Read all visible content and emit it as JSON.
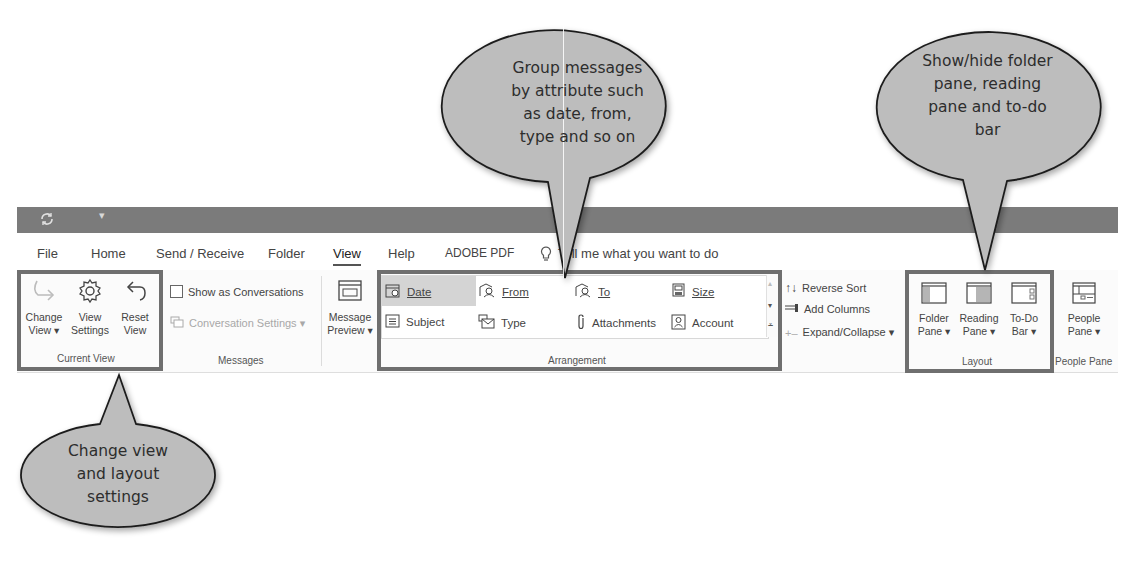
{
  "title_bar": {
    "quick_access": [
      "sync-icon",
      "customize-dropdown-icon"
    ]
  },
  "tabs": [
    {
      "label": "File"
    },
    {
      "label": "Home"
    },
    {
      "label": "Send / Receive"
    },
    {
      "label": "Folder"
    },
    {
      "label": "View",
      "active": true
    },
    {
      "label": "Help"
    },
    {
      "label": "ADOBE PDF"
    }
  ],
  "tell_me": {
    "icon": "lightbulb-icon",
    "text": "Tell me what you want to do"
  },
  "ribbon": {
    "current_view": {
      "label": "Current View",
      "buttons": [
        {
          "line1": "Change",
          "line2": "View ▾",
          "icon": "change-view-icon"
        },
        {
          "line1": "View",
          "line2": "Settings",
          "icon": "gear-icon"
        },
        {
          "line1": "Reset",
          "line2": "View",
          "icon": "undo-arrow-icon"
        }
      ]
    },
    "messages": {
      "label": "Messages",
      "show_as_conversations": "Show as Conversations",
      "conversation_settings": "Conversation Settings ▾"
    },
    "message_preview": {
      "line1": "Message",
      "line2": "Preview ▾"
    },
    "arrangement": {
      "label": "Arrangement",
      "items": [
        {
          "label": "Date",
          "icon": "calendar-clock-icon",
          "selected": true
        },
        {
          "label": "From",
          "icon": "from-people-icon"
        },
        {
          "label": "To",
          "icon": "to-people-icon"
        },
        {
          "label": "Size",
          "icon": "size-icon"
        },
        {
          "label": "Subject",
          "icon": "subject-lines-icon"
        },
        {
          "label": "Type",
          "icon": "type-envelope-icon"
        },
        {
          "label": "Attachments",
          "icon": "paperclip-icon"
        },
        {
          "label": "Account",
          "icon": "account-contact-icon"
        }
      ],
      "side_options": {
        "reverse_sort": "Reverse Sort",
        "add_columns": "Add Columns",
        "expand_collapse": "Expand/Collapse ▾"
      }
    },
    "layout": {
      "label": "Layout",
      "buttons": [
        {
          "line1": "Folder",
          "line2": "Pane ▾"
        },
        {
          "line1": "Reading",
          "line2": "Pane ▾"
        },
        {
          "line1": "To-Do",
          "line2": "Bar ▾"
        }
      ]
    },
    "people_pane": {
      "label": "People Pane",
      "button": {
        "line1": "People",
        "line2": "Pane ▾"
      }
    }
  },
  "callouts": [
    {
      "lines": [
        "Group messages",
        "by attribute such",
        "as date, from,",
        "type and so on"
      ]
    },
    {
      "lines": [
        "Show/hide folder",
        "pane, reading",
        "pane and to-do",
        "bar"
      ]
    },
    {
      "lines": [
        "Change view",
        "and layout",
        "settings"
      ]
    }
  ],
  "colors": {
    "title_bar": "#7b7b7b",
    "highlight_border": "#6f6f6f",
    "bubble_fill": "#bdbdbd",
    "bubble_stroke": "#1e1e1e",
    "selected_item": "#d4d4d4"
  }
}
